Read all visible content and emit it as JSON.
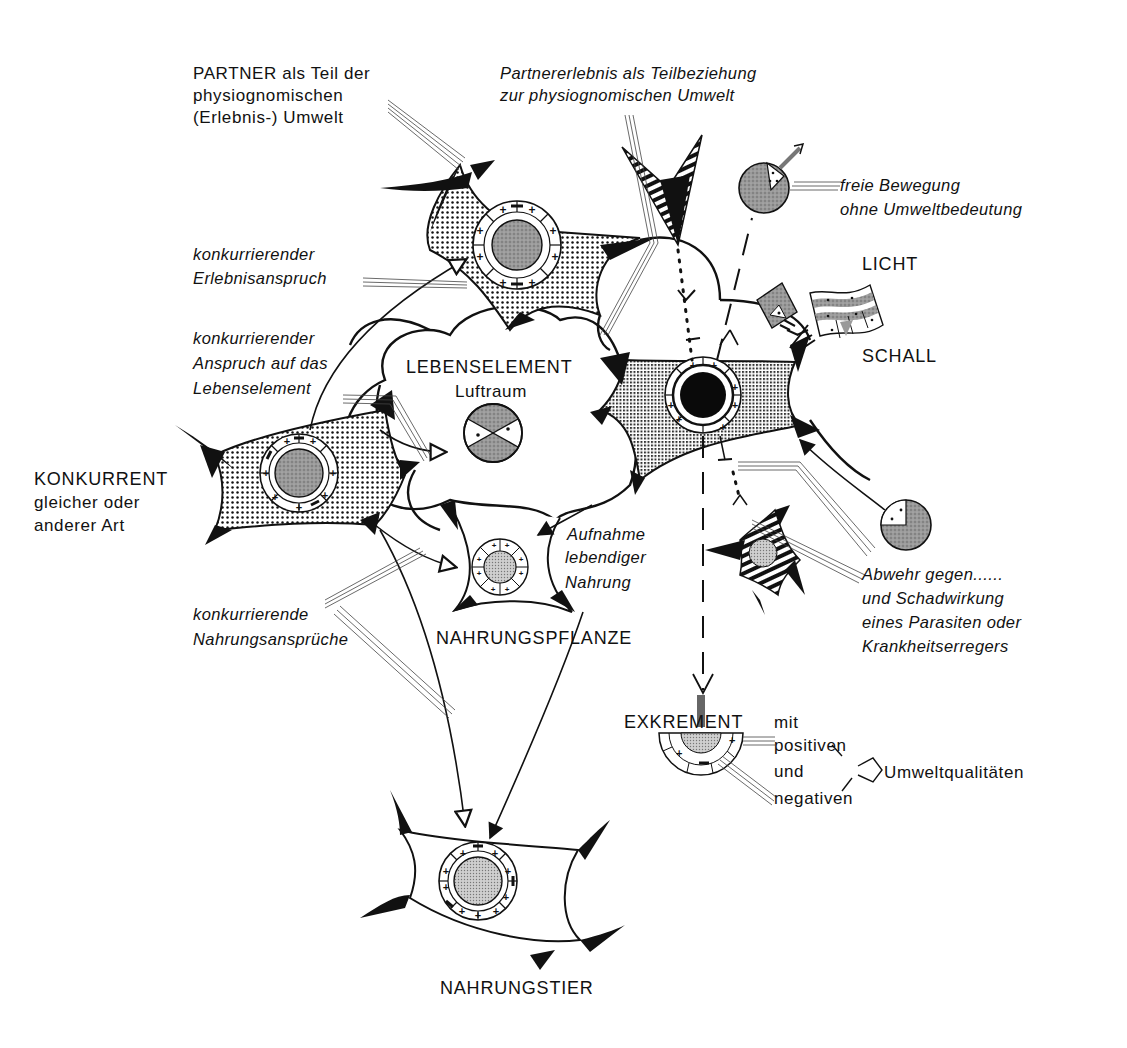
{
  "diagram": {
    "type": "ecological environment (Umwelt) relationship diagram",
    "colors": {
      "ink": "#111111",
      "background": "#ffffff",
      "stipple": "#777777"
    }
  },
  "labels": {
    "partner": {
      "line1": "PARTNER als Teil der",
      "line2": "physiognomischen",
      "line3": "(Erlebnis-) Umwelt"
    },
    "partnererlebnis": {
      "line1": "Partnererlebnis als Teilbeziehung",
      "line2": "zur physiognomischen Umwelt"
    },
    "freie_bewegung": {
      "line1": "freie Bewegung",
      "line2": "ohne Umweltbedeutung"
    },
    "licht": "LICHT",
    "schall": "SCHALL",
    "erlebnisanspruch": {
      "line1": "konkurrierender",
      "line2": "Erlebnisanspruch"
    },
    "anspruch_lebenselement": {
      "line1": "konkurrierender",
      "line2": "Anspruch auf das",
      "line3": "Lebenselement"
    },
    "lebenselement": {
      "line1": "LEBENSELEMENT",
      "line2": "Luftraum"
    },
    "konkurrent": {
      "line1": "KONKURRENT",
      "line2": "gleicher oder",
      "line3": "anderer Art"
    },
    "aufnahme": {
      "line1": "Aufnahme",
      "line2": "lebendiger",
      "line3": "Nahrung"
    },
    "nahrungsansprueche": {
      "line1": "konkurrierende",
      "line2": "Nahrungsansprüche"
    },
    "nahrungspflanze": "NAHRUNGSPFLANZE",
    "abwehr": {
      "line1": "Abwehr gegen......",
      "line2": "und Schadwirkung",
      "line3": "eines Parasiten oder",
      "line4": "Krankheitserregers"
    },
    "exkrement": {
      "title": "EXKREMENT",
      "mit": "mit",
      "positiven": "positiven",
      "und": "und",
      "negativen": "negativen",
      "umweltqualitaeten": "Umweltqualitäten"
    },
    "nahrungstier": "NAHRUNGSTIER"
  },
  "nodes": [
    {
      "id": "partner",
      "ring_symbols": [
        "+",
        "+",
        "-",
        "+",
        "+",
        "+",
        "-",
        "+",
        "+",
        "-",
        "+",
        "+"
      ]
    },
    {
      "id": "central-organism",
      "ring_symbols": [
        "+",
        "+",
        "+",
        "+",
        "+",
        "+",
        "+",
        "+"
      ]
    },
    {
      "id": "konkurrent",
      "ring_symbols": [
        "+",
        "-",
        "+",
        "+",
        "+",
        "-",
        "+",
        "+",
        "+",
        "-"
      ]
    },
    {
      "id": "nahrungspflanze",
      "ring_symbols": [
        "+",
        "+",
        "+",
        "+",
        "+",
        "+",
        "+",
        "+"
      ]
    },
    {
      "id": "nahrungstier",
      "ring_symbols": [
        "+",
        "-",
        "+",
        "+",
        "-",
        "+",
        "+",
        "+",
        "-",
        "+"
      ]
    },
    {
      "id": "parasit"
    },
    {
      "id": "exkrement",
      "ring_symbols": [
        "+",
        "-",
        "+"
      ]
    }
  ]
}
